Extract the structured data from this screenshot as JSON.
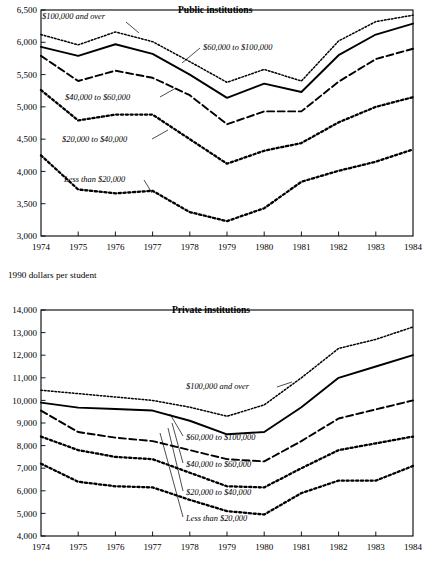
{
  "figure": {
    "y_axis_caption": "1990 dollars per student"
  },
  "chart_data": [
    {
      "type": "line",
      "title": "Public institutions",
      "xlabel": "",
      "ylabel": "1990 dollars per student",
      "x": [
        1974,
        1975,
        1976,
        1977,
        1978,
        1979,
        1980,
        1981,
        1982,
        1983,
        1984
      ],
      "categories": [
        "1974",
        "1975",
        "1976",
        "1977",
        "1978",
        "1979",
        "1980",
        "1981",
        "1982",
        "1983",
        "1984"
      ],
      "ylim": [
        3000,
        6500
      ],
      "yticks": [
        3000,
        3500,
        4000,
        4500,
        5000,
        5500,
        6000,
        6500
      ],
      "ytick_labels": [
        "3,000",
        "3,500",
        "4,000",
        "4,500",
        "5,000",
        "5,500",
        "6,000",
        "6,500"
      ],
      "grid": false,
      "legend_position": "inline-annotations",
      "series": [
        {
          "name": "$100,000 and over",
          "style": "dotted",
          "values": [
            6120,
            5960,
            6160,
            6010,
            5700,
            5380,
            5580,
            5400,
            6020,
            6320,
            6420
          ]
        },
        {
          "name": "$60,000 to $100,000",
          "style": "solid",
          "values": [
            5930,
            5790,
            5970,
            5820,
            5500,
            5140,
            5360,
            5230,
            5800,
            6120,
            6290
          ]
        },
        {
          "name": "$40,000 to $60,000",
          "style": "dashed",
          "values": [
            5790,
            5400,
            5560,
            5450,
            5180,
            4730,
            4930,
            4930,
            5390,
            5740,
            5900
          ]
        },
        {
          "name": "$20,000 to $40,000",
          "style": "dotted-bold",
          "values": [
            5260,
            4790,
            4880,
            4880,
            4500,
            4120,
            4320,
            4440,
            4760,
            5000,
            5150
          ]
        },
        {
          "name": "Less than $20,000",
          "style": "dotted-bold",
          "values": [
            4250,
            3720,
            3660,
            3700,
            3370,
            3230,
            3430,
            3840,
            4010,
            4150,
            4340
          ]
        }
      ]
    },
    {
      "type": "line",
      "title": "Private institutions",
      "xlabel": "",
      "ylabel": "1990 dollars per student",
      "x": [
        1974,
        1975,
        1976,
        1977,
        1978,
        1979,
        1980,
        1981,
        1982,
        1983,
        1984
      ],
      "categories": [
        "1974",
        "1975",
        "1976",
        "1977",
        "1978",
        "1979",
        "1980",
        "1981",
        "1982",
        "1983",
        "1984"
      ],
      "ylim": [
        4000,
        14000
      ],
      "yticks": [
        4000,
        5000,
        6000,
        7000,
        8000,
        9000,
        10000,
        11000,
        12000,
        13000,
        14000
      ],
      "ytick_labels": [
        "4,000",
        "5,000",
        "6,000",
        "7,000",
        "8,000",
        "9,000",
        "10,000",
        "11,000",
        "12,000",
        "13,000",
        "14,000"
      ],
      "grid": false,
      "legend_position": "inline-annotations",
      "series": [
        {
          "name": "$100,000 and over",
          "style": "dotted",
          "values": [
            10450,
            10300,
            10150,
            10000,
            9700,
            9300,
            9800,
            11000,
            12300,
            12700,
            13250
          ]
        },
        {
          "name": "$60,000 to $100,000",
          "style": "solid",
          "values": [
            9900,
            9680,
            9620,
            9550,
            9100,
            8500,
            8600,
            9700,
            11000,
            11500,
            12000
          ]
        },
        {
          "name": "$40,000 to $60,000",
          "style": "dashed",
          "values": [
            9550,
            8600,
            8350,
            8200,
            7800,
            7400,
            7300,
            8200,
            9200,
            9600,
            10000
          ]
        },
        {
          "name": "$20,000 to $40,000",
          "style": "dotted-bold",
          "values": [
            8400,
            7800,
            7500,
            7400,
            6800,
            6200,
            6150,
            7000,
            7800,
            8100,
            8400
          ]
        },
        {
          "name": "Less than $20,000",
          "style": "dotted-bold",
          "values": [
            7200,
            6400,
            6200,
            6150,
            5600,
            5100,
            4950,
            5900,
            6450,
            6450,
            7100
          ]
        }
      ]
    }
  ]
}
